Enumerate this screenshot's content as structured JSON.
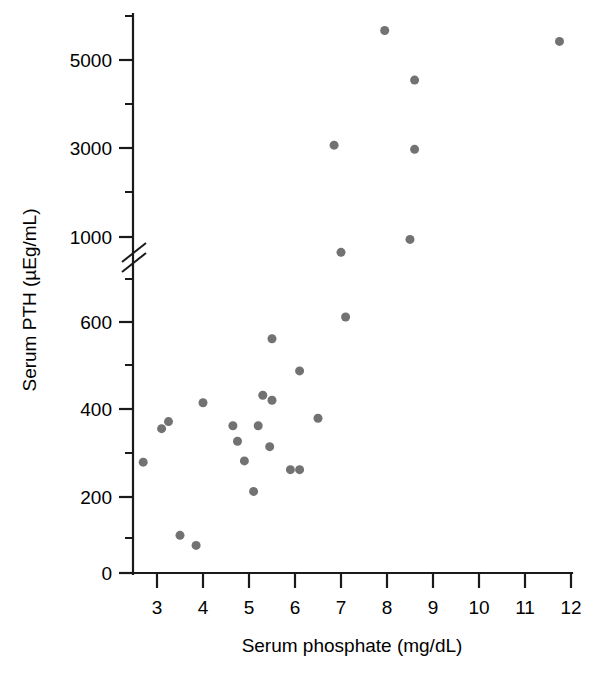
{
  "chart_data": {
    "type": "scatter",
    "title": "",
    "xlabel": "Serum phosphate (mg/dL)",
    "ylabel": "Serum PTH (µEg/mL)",
    "xlim": [
      2.5,
      12.5
    ],
    "ylim": [
      0,
      6000
    ],
    "grid": false,
    "legend": null,
    "axis_break": {
      "axis": "y",
      "between": [
        700,
        900
      ],
      "note": "y axis broken between the 600-scale and the 1000-5000 scale"
    },
    "xticks": [
      3,
      4,
      5,
      6,
      7,
      8,
      9,
      10,
      11,
      12
    ],
    "xtick_labels": [
      "3",
      "4",
      "5",
      "6",
      "7",
      "8",
      "9",
      "10",
      "11",
      "12"
    ],
    "yticks": [
      0,
      200,
      400,
      600,
      1000,
      3000,
      5000
    ],
    "ytick_labels": [
      "0",
      "200",
      "400",
      "600",
      "1000",
      "3000",
      "5000"
    ],
    "yticks_minor": [
      100,
      300,
      500,
      700,
      800,
      2000,
      4000,
      6000
    ],
    "marker": {
      "shape": "circle",
      "color": "#727272",
      "size": 9
    },
    "n_points": 28,
    "points": [
      {
        "x": 2.7,
        "y": 265
      },
      {
        "x": 3.1,
        "y": 345
      },
      {
        "x": 3.25,
        "y": 362
      },
      {
        "x": 3.5,
        "y": 90
      },
      {
        "x": 3.85,
        "y": 66
      },
      {
        "x": 4.0,
        "y": 407
      },
      {
        "x": 4.65,
        "y": 352
      },
      {
        "x": 4.75,
        "y": 315
      },
      {
        "x": 4.9,
        "y": 268
      },
      {
        "x": 5.1,
        "y": 195
      },
      {
        "x": 5.2,
        "y": 352
      },
      {
        "x": 5.3,
        "y": 425
      },
      {
        "x": 5.45,
        "y": 302
      },
      {
        "x": 5.5,
        "y": 413
      },
      {
        "x": 5.5,
        "y": 560
      },
      {
        "x": 5.9,
        "y": 247
      },
      {
        "x": 6.1,
        "y": 247
      },
      {
        "x": 6.1,
        "y": 483
      },
      {
        "x": 6.5,
        "y": 370
      },
      {
        "x": 6.85,
        "y": 3050
      },
      {
        "x": 7.0,
        "y": 880
      },
      {
        "x": 7.1,
        "y": 612
      },
      {
        "x": 7.95,
        "y": 5650
      },
      {
        "x": 8.5,
        "y": 980
      },
      {
        "x": 8.6,
        "y": 2950
      },
      {
        "x": 8.6,
        "y": 4450
      },
      {
        "x": 11.75,
        "y": 5400
      }
    ]
  },
  "colors": {
    "marker": "#727272",
    "axis": "#1a1a1a",
    "background": "#ffffff"
  }
}
